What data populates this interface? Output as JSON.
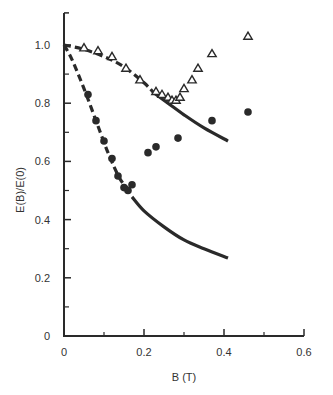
{
  "chart_data": {
    "type": "scatter",
    "title": "",
    "xlabel": "B (T)",
    "ylabel": "E(B)/E(0)",
    "xlim": [
      0,
      0.6
    ],
    "ylim": [
      0,
      1.0
    ],
    "x_ticks": [
      "0",
      "0.2",
      "0.4",
      "0.6"
    ],
    "x_tick_values": [
      0,
      0.2,
      0.4,
      0.6
    ],
    "x_minor_ticks": [
      0.1,
      0.3,
      0.5
    ],
    "y_ticks": [
      "0",
      "0.2",
      "0.4",
      "0.6",
      "0.8",
      "1.0"
    ],
    "y_tick_values": [
      0,
      0.2,
      0.4,
      0.6,
      0.8,
      1.0
    ],
    "y_minor_ticks": [
      0.1,
      0.3,
      0.5,
      0.7,
      0.9
    ],
    "grid": false,
    "series": [
      {
        "name": "open-triangles",
        "marker": "triangle-open",
        "points": [
          [
            0.05,
            0.99
          ],
          [
            0.085,
            0.98
          ],
          [
            0.12,
            0.96
          ],
          [
            0.155,
            0.92
          ],
          [
            0.19,
            0.88
          ],
          [
            0.23,
            0.84
          ],
          [
            0.245,
            0.83
          ],
          [
            0.26,
            0.82
          ],
          [
            0.27,
            0.81
          ],
          [
            0.28,
            0.81
          ],
          [
            0.29,
            0.82
          ],
          [
            0.3,
            0.85
          ],
          [
            0.32,
            0.88
          ],
          [
            0.335,
            0.92
          ],
          [
            0.37,
            0.97
          ],
          [
            0.46,
            1.03
          ]
        ]
      },
      {
        "name": "filled-circles",
        "marker": "circle-filled",
        "points": [
          [
            0.06,
            0.83
          ],
          [
            0.08,
            0.74
          ],
          [
            0.1,
            0.67
          ],
          [
            0.12,
            0.61
          ],
          [
            0.135,
            0.55
          ],
          [
            0.15,
            0.51
          ],
          [
            0.16,
            0.5
          ],
          [
            0.17,
            0.52
          ],
          [
            0.21,
            0.63
          ],
          [
            0.23,
            0.65
          ],
          [
            0.285,
            0.68
          ],
          [
            0.37,
            0.74
          ],
          [
            0.46,
            0.77
          ]
        ]
      }
    ],
    "curves": [
      {
        "name": "upper-theory-dashed",
        "style": "dashed",
        "points": [
          [
            0,
            1.0
          ],
          [
            0.05,
            0.985
          ],
          [
            0.1,
            0.96
          ],
          [
            0.15,
            0.925
          ],
          [
            0.2,
            0.87
          ],
          [
            0.225,
            0.835
          ]
        ]
      },
      {
        "name": "upper-theory-solid",
        "style": "solid",
        "points": [
          [
            0.225,
            0.835
          ],
          [
            0.26,
            0.8
          ],
          [
            0.3,
            0.76
          ],
          [
            0.35,
            0.715
          ],
          [
            0.41,
            0.67
          ]
        ]
      },
      {
        "name": "lower-theory-dashed",
        "style": "dashed",
        "points": [
          [
            0,
            1.0
          ],
          [
            0.02,
            0.95
          ],
          [
            0.05,
            0.85
          ],
          [
            0.08,
            0.74
          ],
          [
            0.11,
            0.63
          ],
          [
            0.14,
            0.54
          ],
          [
            0.165,
            0.5
          ]
        ]
      },
      {
        "name": "lower-theory-solid",
        "style": "solid",
        "points": [
          [
            0.17,
            0.478
          ],
          [
            0.2,
            0.43
          ],
          [
            0.25,
            0.375
          ],
          [
            0.3,
            0.33
          ],
          [
            0.35,
            0.3
          ],
          [
            0.41,
            0.268
          ]
        ]
      }
    ]
  }
}
